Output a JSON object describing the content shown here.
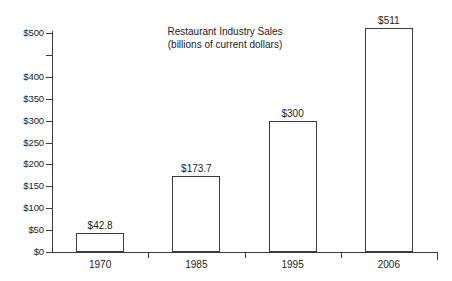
{
  "chart_data": {
    "type": "bar",
    "title": "Restaurant Industry Sales",
    "subtitle": "(billions of current dollars)",
    "xlabel": "",
    "ylabel": "",
    "categories": [
      "1970",
      "1985",
      "1995",
      "2006"
    ],
    "values": [
      42.8,
      173.7,
      300,
      511
    ],
    "value_labels": [
      "$42.8",
      "$173.7",
      "$300",
      "$511"
    ],
    "ylim": [
      0,
      500
    ],
    "ytick_values": [
      500,
      450,
      400,
      350,
      300,
      250,
      200,
      150,
      100,
      50,
      0
    ],
    "ytick_labels": [
      "$500",
      "",
      "$400",
      "$350",
      "$300",
      "$250",
      "$200",
      "$150",
      "$100",
      "$50",
      "$0"
    ],
    "grid": false,
    "legend": false,
    "bar_fill": "#ffffff",
    "bar_stroke": "#3a3a3a",
    "axis_color": "#3a3a3a",
    "background": "#ffffff"
  }
}
